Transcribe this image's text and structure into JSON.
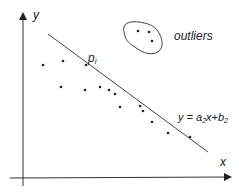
{
  "diagram": {
    "axes": {
      "x_label": "x",
      "y_label": "y"
    },
    "line_label": {
      "prefix": "y = a",
      "sub_a": "2",
      "mid": "x+b",
      "sub_b": "2"
    },
    "point_label": {
      "base": "p",
      "sub": "i"
    },
    "outliers_label": "outliers",
    "colors": {
      "ink": "#222222",
      "background": "#ffffff"
    },
    "points": [
      {
        "x": 43,
        "y": 65
      },
      {
        "x": 63,
        "y": 61
      },
      {
        "x": 86,
        "y": 65
      },
      {
        "x": 61,
        "y": 87
      },
      {
        "x": 85,
        "y": 90
      },
      {
        "x": 100,
        "y": 87
      },
      {
        "x": 109,
        "y": 90
      },
      {
        "x": 115,
        "y": 94
      },
      {
        "x": 120,
        "y": 107
      },
      {
        "x": 140,
        "y": 106
      },
      {
        "x": 143,
        "y": 111
      },
      {
        "x": 152,
        "y": 122
      },
      {
        "x": 168,
        "y": 133
      },
      {
        "x": 190,
        "y": 137
      }
    ],
    "outliers": [
      {
        "x": 138,
        "y": 31
      },
      {
        "x": 149,
        "y": 32
      },
      {
        "x": 152,
        "y": 41
      }
    ]
  }
}
